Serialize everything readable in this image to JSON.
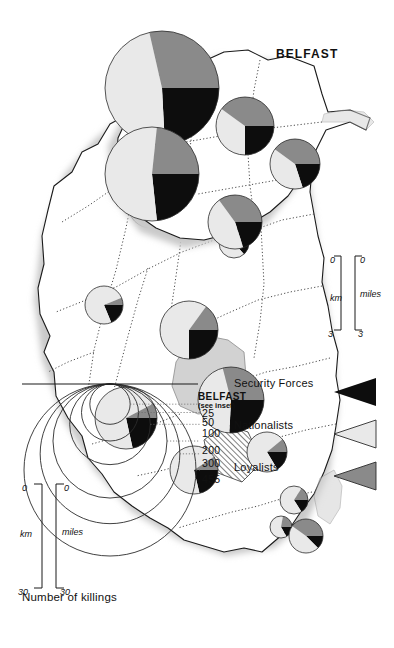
{
  "figure": {
    "kind": "thematic-map",
    "region": "Northern Ireland",
    "inset_title": "BELFAST",
    "belfast_reference": "BELFAST",
    "belfast_reference_sub": "(see inset)"
  },
  "legend": {
    "categories": [
      {
        "label": "Security Forces",
        "color": "#0d0d0d",
        "marker": "wedge-triangle-icon"
      },
      {
        "label": "Nationalists",
        "color": "#e9e9e9",
        "marker": "wedge-triangle-icon"
      },
      {
        "label": "Loyalists",
        "color": "#8a8a8a",
        "marker": "wedge-triangle-icon"
      }
    ],
    "size_legend": {
      "title": "Number of killings",
      "values": [
        455,
        300,
        200,
        100,
        50,
        25
      ]
    }
  },
  "scales": {
    "main": {
      "miles": {
        "unit": "miles",
        "min": "0",
        "max": "30"
      },
      "km": {
        "unit": "km",
        "min": "0",
        "max": "30"
      }
    },
    "inset": {
      "miles": {
        "unit": "miles",
        "min": "0",
        "max": "3"
      },
      "km": {
        "unit": "km",
        "min": "0",
        "max": "3"
      }
    }
  },
  "chart_data": {
    "type": "pie",
    "title": "Number of killings",
    "categories": [
      "Security Forces",
      "Nationalists",
      "Loyalists"
    ],
    "colors": [
      "#0d0d0d",
      "#e9e9e9",
      "#8a8a8a"
    ],
    "value_legend": [
      455,
      300,
      200,
      100,
      50,
      25
    ],
    "main_map_pies": [
      {
        "name": "pie-north-coast",
        "total": 55,
        "values": [
          10,
          40,
          5
        ],
        "cx": 118,
        "cy": 92,
        "r": 20
      },
      {
        "name": "pie-northwest",
        "total": 40,
        "values": [
          6,
          31,
          3
        ],
        "cx": 182,
        "cy": 122,
        "r": 17
      },
      {
        "name": "pie-mid-ulster",
        "total": 30,
        "values": [
          4,
          24,
          2
        ],
        "cx": 243,
        "cy": 160,
        "r": 15
      },
      {
        "name": "pie-west-border",
        "total": 70,
        "values": [
          14,
          50,
          6
        ],
        "cx": 205,
        "cy": 243,
        "r": 23
      },
      {
        "name": "pie-south-border",
        "total": 48,
        "values": [
          9,
          36,
          3
        ],
        "cx": 305,
        "cy": 290,
        "r": 19
      },
      {
        "name": "pie-mid-east",
        "total": 120,
        "values": [
          30,
          72,
          18
        ],
        "cx": 330,
        "cy": 205,
        "r": 29
      },
      {
        "name": "pie-lough-shore",
        "total": 155,
        "values": [
          40,
          70,
          45
        ],
        "cx": 400,
        "cy": 163,
        "r": 33
      },
      {
        "name": "pie-south-east",
        "total": 130,
        "values": [
          28,
          92,
          10
        ],
        "cx": 418,
        "cy": 268,
        "r": 31
      },
      {
        "name": "pie-east-coast",
        "total": 75,
        "values": [
          16,
          52,
          7
        ],
        "cx": 470,
        "cy": 200,
        "r": 24
      },
      {
        "name": "pie-north-east",
        "total": 55,
        "values": [
          9,
          40,
          6
        ],
        "cx": 452,
        "cy": 127,
        "r": 20
      },
      {
        "name": "pie-antrim-small",
        "total": 25,
        "values": [
          4,
          17,
          4
        ],
        "cx": 500,
        "cy": 100,
        "r": 14
      },
      {
        "name": "pie-antrim-tiny",
        "total": 18,
        "values": [
          3,
          11,
          4
        ],
        "cx": 527,
        "cy": 113,
        "r": 11
      },
      {
        "name": "pie-newtownabbey",
        "total": 40,
        "values": [
          5,
          19,
          16
        ],
        "cx": 536,
        "cy": 88,
        "r": 17
      }
    ],
    "inset_map_pies": [
      {
        "name": "inset-pie-north",
        "total": 90,
        "values": [
          18,
          36,
          36
        ],
        "cx": 138,
        "cy": 85,
        "r": 25
      },
      {
        "name": "inset-pie-centre",
        "total": 120,
        "values": [
          30,
          42,
          48
        ],
        "cx": 100,
        "cy": 135,
        "r": 29
      },
      {
        "name": "inset-pie-west",
        "total": 455,
        "values": [
          110,
          215,
          130
        ],
        "cx": 62,
        "cy": 218,
        "r": 57
      },
      {
        "name": "inset-pie-south",
        "total": 300,
        "values": [
          70,
          160,
          70
        ],
        "cx": 148,
        "cy": 228,
        "r": 47
      },
      {
        "name": "inset-pie-east",
        "total": 100,
        "values": [
          20,
          45,
          35
        ],
        "cx": 196,
        "cy": 145,
        "r": 27
      }
    ]
  }
}
